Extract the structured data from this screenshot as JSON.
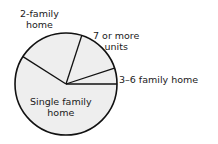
{
  "chart_data": {
    "type": "pie",
    "title": "",
    "categories": [
      "Single family home",
      "2-family home",
      "7 or more units",
      "3–6 family home"
    ],
    "values": [
      59,
      21,
      15,
      5
    ],
    "unit": "percent (estimated from slice angles)",
    "legend": "none (direct labels)",
    "slice_fill": "#eeeeee",
    "line_color": "#111111"
  },
  "labels": {
    "two_family_line1": "2-family",
    "two_family_line2": "home",
    "seven_plus_line1": "7 or more",
    "seven_plus_line2": "units",
    "three_six": "3–6 family home",
    "single_line1": "Single family",
    "single_line2": "home"
  }
}
